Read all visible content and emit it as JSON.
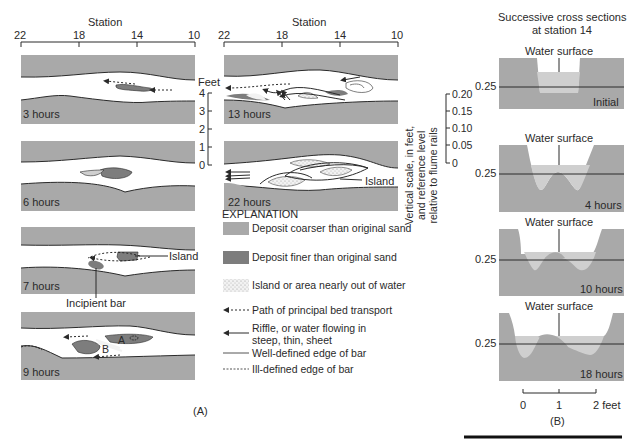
{
  "panel_a": {
    "station_label": "Station",
    "station_ticks": [
      "22",
      "18",
      "14",
      "10"
    ],
    "feet_label": "Feet",
    "feet_ticks": [
      "4",
      "3",
      "2",
      "1",
      "0"
    ],
    "vertical_label_lines": [
      "Vertical scale, in feet,",
      "and reference level",
      "relative to flume rails"
    ],
    "vertical_ticks": [
      "0.20",
      "0.15",
      "0.10",
      "0.05",
      "0"
    ],
    "stages": [
      {
        "label": "3 hours"
      },
      {
        "label": "6 hours"
      },
      {
        "label": "7 hours",
        "annotations": [
          "Island",
          "Incipient bar"
        ]
      },
      {
        "label": "9 hours",
        "annotations": [
          "A",
          "B"
        ]
      },
      {
        "label": "13 hours"
      },
      {
        "label": "22 hours",
        "annotations": [
          "Island"
        ]
      }
    ],
    "caption": "(A)"
  },
  "explanation": {
    "title": "EXPLANATION",
    "items": [
      {
        "symbol": "coarse-deposit-swatch",
        "text": "Deposit coarser than original sand"
      },
      {
        "symbol": "fine-deposit-swatch",
        "text": "Deposit finer than original sand"
      },
      {
        "symbol": "island-stipple-swatch",
        "text": "Island or area nearly out of water"
      },
      {
        "symbol": "dashed-arrow",
        "text": "Path of principal bed transport"
      },
      {
        "symbol": "solid-arrow",
        "text": "Riffle, or water flowing in steep, thin, sheet"
      },
      {
        "symbol": "solid-line",
        "text": "Well-defined edge of bar"
      },
      {
        "symbol": "dashed-line",
        "text": "Ill-defined edge of bar"
      }
    ]
  },
  "panel_b": {
    "title_lines": [
      "Successive cross sections",
      "at station 14"
    ],
    "sections": [
      {
        "water_label": "Water surface",
        "level_label": "0.25",
        "stage": "Initial"
      },
      {
        "water_label": "Water surface",
        "level_label": "0.25",
        "stage": "4 hours"
      },
      {
        "water_label": "Water surface",
        "level_label": "0.25",
        "stage": "10 hours"
      },
      {
        "water_label": "Water surface",
        "level_label": "0.25",
        "stage": "18 hours"
      }
    ],
    "scale_ticks": [
      "0",
      "1",
      "2 feet"
    ],
    "caption": "(B)"
  },
  "colors": {
    "coarse": "#a9a9a9",
    "fine": "#7d7d7d",
    "water": "#cfcfcf",
    "line": "#2a2a2a"
  }
}
